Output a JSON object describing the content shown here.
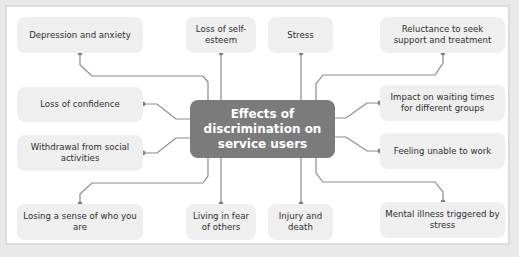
{
  "diagram": {
    "center": {
      "line1": "Effects of",
      "line2": "discrimination on",
      "line3": "service users"
    },
    "nodes": [
      {
        "id": "depression-anxiety",
        "label": "Depression and anxiety"
      },
      {
        "id": "loss-self-esteem",
        "label": "Loss of self-esteem"
      },
      {
        "id": "stress",
        "label": "Stress"
      },
      {
        "id": "reluctance-support",
        "label": "Reluctance to seek support and treatment"
      },
      {
        "id": "loss-confidence",
        "label": "Loss of confidence"
      },
      {
        "id": "impact-waiting-times",
        "label": "Impact on waiting times for different groups"
      },
      {
        "id": "withdrawal-social",
        "label": "Withdrawal from social activities"
      },
      {
        "id": "feeling-unable-work",
        "label": "Feeling unable to work"
      },
      {
        "id": "losing-sense-self",
        "label": "Losing a sense of who you are"
      },
      {
        "id": "living-in-fear",
        "label": "Living in fear of others"
      },
      {
        "id": "injury-death",
        "label": "Injury and death"
      },
      {
        "id": "mental-illness-stress",
        "label": "Mental illness triggered by stress"
      }
    ],
    "colors": {
      "center_fill": "#7b7b7b",
      "node_fill": "#efefef",
      "connector": "#8a8a8a",
      "frame_border": "#dcdcdc",
      "background": "#e9e9e9"
    }
  }
}
